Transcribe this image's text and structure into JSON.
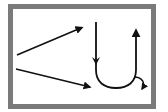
{
  "diagram": {
    "frame": {
      "border_color": "#7a7a7a",
      "background": "#ffffff"
    },
    "stroke_color": "#111111",
    "elements": [
      {
        "id": "upper-diagonal-arrow",
        "type": "arrow",
        "from": [
          17,
          55
        ],
        "to": [
          83,
          27
        ]
      },
      {
        "id": "lower-diagonal-arrow",
        "type": "arrow",
        "from": [
          16,
          69
        ],
        "to": [
          91,
          87
        ]
      },
      {
        "id": "u-turn-arrow",
        "type": "u-curve",
        "left_stem_top": [
          96,
          22
        ],
        "bottom_y": 88,
        "right_stem_top": [
          136,
          28
        ],
        "direction": "down-then-up"
      },
      {
        "id": "small-curved-arrow",
        "type": "curved-arrow",
        "from": [
          134,
          76
        ],
        "to": [
          142,
          90
        ]
      }
    ]
  }
}
